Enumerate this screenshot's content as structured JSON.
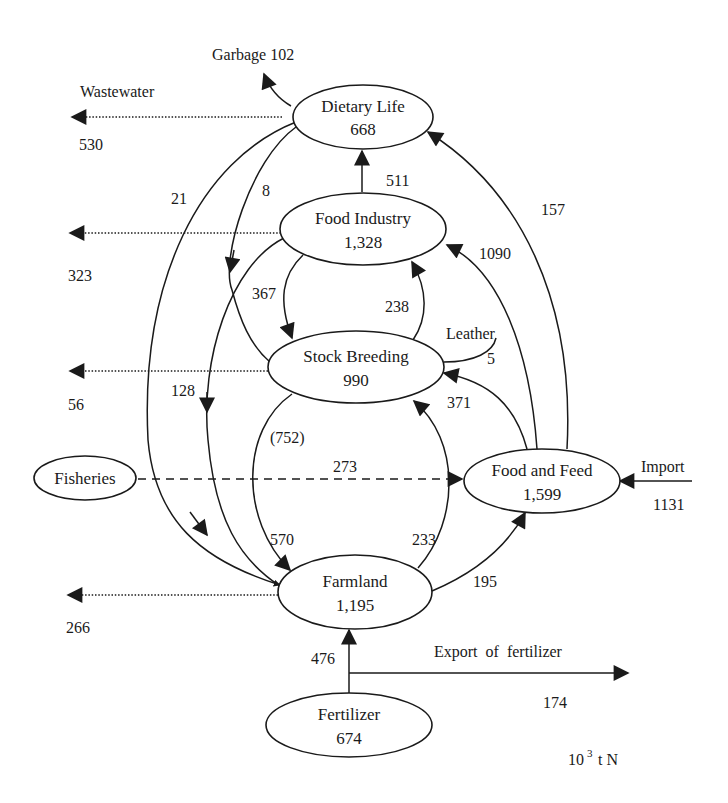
{
  "diagram": {
    "unit": {
      "base": "10",
      "exponent": "3",
      "suffix": "t N"
    },
    "nodes": {
      "dietary_life": {
        "name": "Dietary Life",
        "value": "668"
      },
      "food_industry": {
        "name": "Food Industry",
        "value": "1,328"
      },
      "stock_breeding": {
        "name": "Stock Breeding",
        "value": "990"
      },
      "food_and_feed": {
        "name": "Food and Feed",
        "value": "1,599"
      },
      "fisheries": {
        "name": "Fisheries"
      },
      "farmland": {
        "name": "Farmland",
        "value": "1,195"
      },
      "fertilizer": {
        "name": "Fertilizer",
        "value": "674"
      }
    },
    "outputs": {
      "garbage": {
        "label": "Garbage 102"
      },
      "wastewater": {
        "label": "Wastewater"
      },
      "leather": {
        "label": "Leather",
        "value": "5"
      },
      "import": {
        "label": "Import",
        "value": "1131"
      },
      "export_fertilizer": {
        "label": "Export  of  fertilizer",
        "value": "174"
      }
    },
    "flows": [
      {
        "id": "wastewater-dietary",
        "from": "Dietary Life",
        "to": "Wastewater",
        "value": "530",
        "style": "dotted"
      },
      {
        "id": "wastewater-food-industry",
        "from": "Food Industry",
        "to": "Wastewater",
        "value": "323",
        "style": "dotted"
      },
      {
        "id": "wastewater-stock",
        "from": "Stock Breeding",
        "to": "Wastewater",
        "value": "56",
        "style": "dotted"
      },
      {
        "id": "wastewater-farmland",
        "from": "Farmland",
        "to": "Wastewater",
        "value": "266",
        "style": "dotted"
      },
      {
        "id": "foodind-to-dietary",
        "from": "Food Industry",
        "to": "Dietary Life",
        "value": "511",
        "style": "solid"
      },
      {
        "id": "foodfeed-to-dietary",
        "from": "Food and Feed",
        "to": "Dietary Life",
        "value": "157",
        "style": "solid"
      },
      {
        "id": "foodfeed-to-foodind",
        "from": "Food and Feed",
        "to": "Food Industry",
        "value": "1090",
        "style": "solid"
      },
      {
        "id": "stock-to-foodind",
        "from": "Stock Breeding",
        "to": "Food Industry",
        "value": "238",
        "style": "solid"
      },
      {
        "id": "foodind-to-stock",
        "from": "Food Industry",
        "to": "Stock Breeding",
        "value": "367",
        "style": "solid"
      },
      {
        "id": "dietary-to-stock",
        "from": "Dietary Life",
        "to": "Stock Breeding",
        "value": "8",
        "style": "solid"
      },
      {
        "id": "dietary-to-farmland",
        "from": "Dietary Life",
        "to": "Farmland",
        "value": "21",
        "style": "solid"
      },
      {
        "id": "foodind-to-farmland",
        "from": "Food Industry",
        "to": "Farmland",
        "value": "128",
        "style": "solid"
      },
      {
        "id": "foodfeed-to-stock",
        "from": "Food and Feed",
        "to": "Stock Breeding",
        "value": "371",
        "style": "solid"
      },
      {
        "id": "stock-to-farmland",
        "from": "Stock Breeding",
        "to": "Farmland",
        "value": "570",
        "note": "(752)",
        "style": "solid"
      },
      {
        "id": "farmland-to-stock",
        "from": "Farmland",
        "to": "Stock Breeding",
        "value": "233",
        "style": "solid"
      },
      {
        "id": "fisheries-to-foodfeed",
        "from": "Fisheries",
        "to": "Food and Feed",
        "value": "273",
        "style": "dashed"
      },
      {
        "id": "farmland-to-foodfeed",
        "from": "Farmland",
        "to": "Food and Feed",
        "value": "195",
        "style": "solid"
      },
      {
        "id": "import-to-foodfeed",
        "from": "Import",
        "to": "Food and Feed",
        "value": "1131",
        "style": "solid"
      },
      {
        "id": "fertilizer-to-farmland",
        "from": "Fertilizer",
        "to": "Farmland",
        "value": "476",
        "style": "solid"
      },
      {
        "id": "fertilizer-export",
        "from": "Fertilizer",
        "to": "Export of fertilizer",
        "value": "174",
        "style": "solid"
      },
      {
        "id": "stock-to-leather",
        "from": "Stock Breeding",
        "to": "Leather",
        "value": "5",
        "style": "solid"
      },
      {
        "id": "dietary-to-garbage",
        "from": "Dietary Life",
        "to": "Garbage",
        "value": "102",
        "style": "solid"
      }
    ]
  }
}
